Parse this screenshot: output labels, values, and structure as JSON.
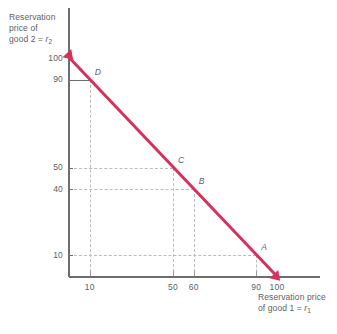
{
  "chart_data": {
    "type": "line",
    "title": "",
    "xlabel": "Reservation price of good 1 = r1",
    "ylabel": "Reservation price of good 2 = r2",
    "xlabel_lines": [
      "Reservation price",
      "of good 1 = r"
    ],
    "xlabel_sub": "1",
    "ylabel_lines": [
      "Reservation",
      "price of",
      "good 2 = r"
    ],
    "ylabel_sub": "2",
    "xlim": [
      0,
      110
    ],
    "ylim": [
      0,
      108
    ],
    "xticks": [
      10,
      50,
      60,
      90,
      100
    ],
    "xtick_labels": [
      "10",
      "50",
      "60",
      "90",
      "100"
    ],
    "yticks": [
      10,
      40,
      50,
      90,
      100
    ],
    "ytick_labels": [
      "10",
      "40",
      "50",
      "90",
      "100"
    ],
    "grid": "dashed-guides-to-labeled-points",
    "legend": "none",
    "series": [
      {
        "name": "budget line",
        "color": "#d8305c",
        "x": [
          0,
          100
        ],
        "y": [
          100,
          0
        ],
        "arrow_start": true,
        "arrow_end": true
      }
    ],
    "annotations": [
      {
        "label": "D",
        "x": 10,
        "y": 90
      },
      {
        "label": "C",
        "x": 50,
        "y": 50
      },
      {
        "label": "B",
        "x": 60,
        "y": 40
      },
      {
        "label": "A",
        "x": 90,
        "y": 10
      }
    ],
    "axis_color": "#6e6e6e",
    "grid_color": "#b9bdc0",
    "text_color": "#5c6165"
  }
}
